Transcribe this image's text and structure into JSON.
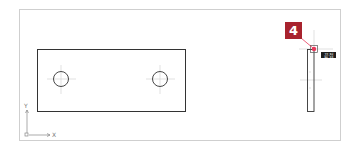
{
  "drawing": {
    "callout": {
      "number": "4",
      "color": "#a8232e"
    },
    "snap_tooltip": {
      "label": "끝점",
      "background": "#1d1d1d"
    },
    "ucs": {
      "x_label": "X",
      "y_label": "Y"
    },
    "front_view": {
      "rect": {
        "x": 37,
        "y": 49,
        "w": 149,
        "h": 62
      },
      "holes": [
        {
          "cx": 61,
          "cy": 79,
          "r": 7.5
        },
        {
          "cx": 160,
          "cy": 79,
          "r": 7.5
        }
      ]
    },
    "side_view": {
      "rect": {
        "x": 307,
        "y": 49,
        "w": 7,
        "h": 62
      }
    },
    "snap_point": {
      "x": 314,
      "y": 49
    },
    "colors": {
      "line": "#333333",
      "centerline": "#c8c8c8",
      "frame": "#cfcfcf",
      "snap": "#e8395a"
    }
  }
}
